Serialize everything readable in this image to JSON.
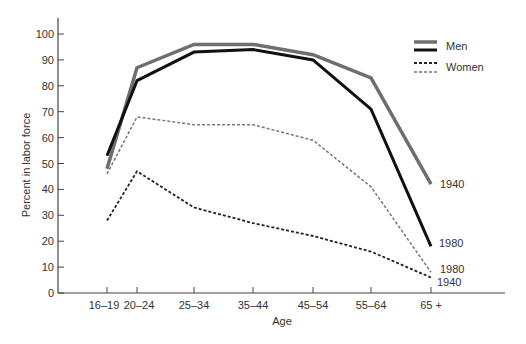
{
  "chart_data": {
    "type": "line",
    "title": "",
    "xlabel": "Age",
    "ylabel": "Percent in labor force",
    "categories": [
      "16–19",
      "20–24",
      "25–34",
      "35–44",
      "45–54",
      "55–64",
      "65 +"
    ],
    "ylim": [
      0,
      100
    ],
    "yticks": [
      0,
      10,
      20,
      30,
      40,
      50,
      60,
      70,
      80,
      90,
      100
    ],
    "grid": false,
    "legend_position": "upper right",
    "legend": [
      {
        "label": "Men",
        "styles": [
          "gray-solid-thick",
          "black-solid-thick"
        ]
      },
      {
        "label": "Women",
        "styles": [
          "black-dashed",
          "gray-dashed"
        ]
      }
    ],
    "series": [
      {
        "name": "Men 1940",
        "group": "Men",
        "year": "1940",
        "color": "#6e6e6e",
        "dash": "solid",
        "width": 3.5,
        "values": [
          48,
          87,
          96,
          96,
          92,
          83,
          42
        ]
      },
      {
        "name": "Men 1980",
        "group": "Men",
        "year": "1980",
        "color": "#111111",
        "dash": "solid",
        "width": 3,
        "values": [
          53,
          82,
          93,
          94,
          90,
          71,
          18
        ]
      },
      {
        "name": "Women 1980",
        "group": "Women",
        "year": "1980",
        "color": "#777777",
        "dash": "dashed",
        "width": 1.5,
        "values": [
          46,
          68,
          65,
          65,
          59,
          41,
          8
        ]
      },
      {
        "name": "Women 1940",
        "group": "Women",
        "year": "1940",
        "color": "#222222",
        "dash": "dashed",
        "width": 1.8,
        "values": [
          28,
          47,
          33,
          27,
          22,
          16,
          6
        ]
      }
    ],
    "annotations": [
      {
        "text": "1940",
        "series": "Men 1940"
      },
      {
        "text": "1980",
        "series": "Men 1980"
      },
      {
        "text": "1980",
        "series": "Women 1980"
      },
      {
        "text": "1940",
        "series": "Women 1940"
      }
    ]
  },
  "legend": {
    "men_label": "Men",
    "women_label": "Women"
  },
  "axes": {
    "x_title": "Age",
    "y_title": "Percent in labor force"
  }
}
